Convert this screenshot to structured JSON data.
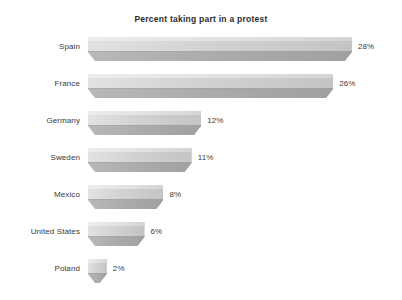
{
  "chart_data": {
    "type": "bar",
    "title": "Percent taking part in a protest",
    "orientation": "horizontal",
    "xlabel": "",
    "ylabel": "",
    "categories": [
      "Spain",
      "France",
      "Germany",
      "Sweden",
      "Mexico",
      "United States",
      "Poland"
    ],
    "values": [
      28,
      26,
      12,
      11,
      8,
      6,
      2
    ],
    "value_labels": [
      "28%",
      "26%",
      "12%",
      "11%",
      "8%",
      "6%",
      "2%"
    ],
    "xlim": [
      0,
      28
    ],
    "grid": false,
    "legend": null,
    "axis_visible": false,
    "style": "3d-grayscale",
    "bar_fill_top": "#d6d6d6",
    "bar_fill_front": "#aeaeae",
    "text_color": "#3a3a3a",
    "background": "#ffffff"
  },
  "chart": {
    "title": "Percent taking part in a protest",
    "rows": [
      {
        "label": "Spain",
        "value": 28,
        "value_label": "28%"
      },
      {
        "label": "France",
        "value": 26,
        "value_label": "26%"
      },
      {
        "label": "Germany",
        "value": 12,
        "value_label": "12%"
      },
      {
        "label": "Sweden",
        "value": 11,
        "value_label": "11%"
      },
      {
        "label": "Mexico",
        "value": 8,
        "value_label": "8%"
      },
      {
        "label": "United States",
        "value": 6,
        "value_label": "6%"
      },
      {
        "label": "Poland",
        "value": 2,
        "value_label": "2%"
      }
    ]
  }
}
